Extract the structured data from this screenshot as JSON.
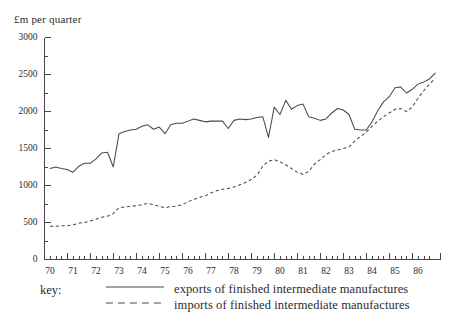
{
  "chart_data": {
    "type": "line",
    "title": "",
    "ylabel": "£m per quarter",
    "xlabel": "",
    "ylim": [
      0,
      3000
    ],
    "xlim": [
      1970.0,
      1986.9
    ],
    "y_major_ticks": [
      0,
      500,
      1000,
      1500,
      2000,
      2500,
      3000
    ],
    "y_minor_tick_interval": 250,
    "x_tick_labels": [
      "70",
      "71",
      "72",
      "73",
      "74",
      "75",
      "76",
      "77",
      "78",
      "79",
      "80",
      "81",
      "82",
      "83",
      "84",
      "85",
      "86"
    ],
    "x_minor_ticks_per_year": 4,
    "grid": false,
    "legend_position": "below-axes",
    "legend_prefix": "key:",
    "x": [
      1970.0,
      1970.25,
      1970.5,
      1970.75,
      1971.0,
      1971.25,
      1971.5,
      1971.75,
      1972.0,
      1972.25,
      1972.5,
      1972.75,
      1973.0,
      1973.25,
      1973.5,
      1973.75,
      1974.0,
      1974.25,
      1974.5,
      1974.75,
      1975.0,
      1975.25,
      1975.5,
      1975.75,
      1976.0,
      1976.25,
      1976.5,
      1976.75,
      1977.0,
      1977.25,
      1977.5,
      1977.75,
      1978.0,
      1978.25,
      1978.5,
      1978.75,
      1979.0,
      1979.25,
      1979.5,
      1979.75,
      1980.0,
      1980.25,
      1980.5,
      1980.75,
      1981.0,
      1981.25,
      1981.5,
      1981.75,
      1982.0,
      1982.25,
      1982.5,
      1982.75,
      1983.0,
      1983.25,
      1983.5,
      1983.75,
      1984.0,
      1984.25,
      1984.5,
      1984.75,
      1985.0,
      1985.25,
      1985.5,
      1985.75,
      1986.0,
      1986.25,
      1986.5,
      1986.75
    ],
    "series": [
      {
        "name": "exports of finished intermediate manufactures",
        "style": "solid",
        "color": "#4a4a4e",
        "values": [
          1230,
          1250,
          1230,
          1215,
          1180,
          1260,
          1300,
          1300,
          1360,
          1440,
          1450,
          1250,
          1700,
          1730,
          1750,
          1760,
          1800,
          1820,
          1760,
          1790,
          1700,
          1820,
          1840,
          1840,
          1870,
          1900,
          1880,
          1860,
          1870,
          1870,
          1870,
          1770,
          1880,
          1900,
          1890,
          1900,
          1920,
          1930,
          1650,
          2060,
          1960,
          2150,
          2030,
          2080,
          2100,
          1930,
          1910,
          1880,
          1900,
          1980,
          2040,
          2020,
          1960,
          1760,
          1750,
          1750,
          1860,
          2010,
          2130,
          2200,
          2320,
          2330,
          2250,
          2300,
          2370,
          2400,
          2440,
          2520
        ]
      },
      {
        "name": "imports of finished intermediate manufactures",
        "style": "dashed",
        "color": "#4a4a4e",
        "values": [
          450,
          450,
          455,
          455,
          470,
          490,
          500,
          520,
          545,
          570,
          585,
          620,
          700,
          710,
          720,
          725,
          740,
          760,
          740,
          720,
          700,
          715,
          720,
          740,
          780,
          810,
          840,
          860,
          900,
          930,
          950,
          960,
          980,
          1010,
          1040,
          1080,
          1140,
          1260,
          1330,
          1350,
          1320,
          1280,
          1230,
          1180,
          1150,
          1190,
          1290,
          1350,
          1420,
          1460,
          1480,
          1500,
          1520,
          1600,
          1660,
          1720,
          1800,
          1870,
          1930,
          1980,
          2030,
          2040,
          2000,
          2060,
          2180,
          2280,
          2370,
          2450
        ]
      }
    ]
  },
  "legend": {
    "key_label": "key:",
    "entries": [
      {
        "label": "exports of finished intermediate manufactures",
        "style": "solid"
      },
      {
        "label": "imports of finished intermediate manufactures",
        "style": "dashed"
      }
    ]
  }
}
